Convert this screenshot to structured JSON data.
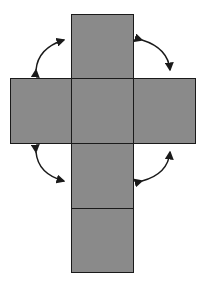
{
  "diagram": {
    "fill_color": "#8a8a8a",
    "stroke_color": "#1a1a1a",
    "squares": [
      {
        "id": "top",
        "x": 71,
        "y": 14,
        "w": 63,
        "h": 65
      },
      {
        "id": "left",
        "x": 10,
        "y": 78,
        "w": 62,
        "h": 66
      },
      {
        "id": "center",
        "x": 71,
        "y": 78,
        "w": 63,
        "h": 66
      },
      {
        "id": "right",
        "x": 133,
        "y": 78,
        "w": 63,
        "h": 66
      },
      {
        "id": "lower",
        "x": 71,
        "y": 143,
        "w": 63,
        "h": 66
      },
      {
        "id": "bottom",
        "x": 71,
        "y": 208,
        "w": 63,
        "h": 65
      }
    ],
    "arrows": [
      {
        "id": "top-left",
        "direction": "double-headed curved"
      },
      {
        "id": "top-right",
        "direction": "double-headed curved"
      },
      {
        "id": "bottom-left",
        "direction": "double-headed curved"
      },
      {
        "id": "bottom-right",
        "direction": "double-headed curved"
      }
    ]
  }
}
